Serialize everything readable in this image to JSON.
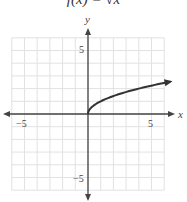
{
  "chart_data": {
    "type": "line",
    "title": "f(x) = √x",
    "xlabel": "x",
    "ylabel": "y",
    "xlim": [
      -6,
      6
    ],
    "ylim": [
      -6,
      6
    ],
    "grid": true,
    "x_ticks_labeled": [
      "-5",
      "5"
    ],
    "y_ticks_labeled": [
      "5",
      "-5"
    ],
    "series": [
      {
        "name": "f(x) = √x",
        "x": [
          0,
          0.25,
          0.5,
          1,
          1.5,
          2,
          3,
          4,
          5,
          6,
          6.5
        ],
        "y": [
          0,
          0.5,
          0.707,
          1,
          1.225,
          1.414,
          1.732,
          2,
          2.236,
          2.449,
          2.55
        ],
        "endpoint_arrow": true
      }
    ]
  },
  "labels": {
    "title": "f(x) = √x",
    "x_axis": "x",
    "y_axis": "y",
    "x_neg5": "−5",
    "x_pos5": "5",
    "y_pos5": "5",
    "y_neg5": "−5"
  }
}
